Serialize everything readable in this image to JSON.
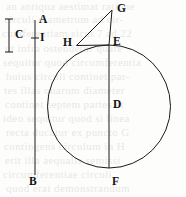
{
  "figure": {
    "width": 186,
    "height": 197,
    "background_color": "#fdfdfc",
    "stroke_color": "#1a1a1a",
    "label_color": "#111111"
  },
  "labels": {
    "A": "A",
    "B": "B",
    "C": "C",
    "D": "D",
    "E": "E",
    "F": "F",
    "G": "G",
    "H": "H",
    "I": "I"
  },
  "geometry": {
    "circle": {
      "cx": 109,
      "cy": 106.5,
      "r": 61.5
    },
    "vertical_line_AB": {
      "x": 35,
      "y_top": 20,
      "y_bottom": 175
    },
    "tick_I": {
      "x": 35,
      "y": 38,
      "half_width": 4
    },
    "measure_C": {
      "x": 9,
      "y_top": 19,
      "y_bottom": 52,
      "cap_half_width": 4
    },
    "diameter_EF": {
      "x": 109,
      "y_top": 45,
      "y_bottom": 168
    },
    "point_G": {
      "x": 112,
      "y": 10
    },
    "point_H": {
      "x": 76.5,
      "y": 45.5
    },
    "point_E": {
      "x": 109,
      "y": 45
    },
    "point_D": {
      "x": 109,
      "y": 106.5
    },
    "point_F": {
      "x": 109,
      "y": 168
    },
    "segment_GH": {
      "x1": 112,
      "y1": 10,
      "x2": 76.5,
      "y2": 45.5
    },
    "segment_GE": {
      "x1": 112,
      "y1": 10,
      "x2": 109,
      "y2": 45
    },
    "segment_HE": {
      "x1": 76.5,
      "y1": 45.5,
      "x2": 109,
      "y2": 45
    }
  },
  "label_positions": {
    "A": {
      "x": 39,
      "y": 17
    },
    "B": {
      "x": 29,
      "y": 176
    },
    "C": {
      "x": 15,
      "y": 30
    },
    "D": {
      "x": 113,
      "y": 100
    },
    "E": {
      "x": 113,
      "y": 37
    },
    "F": {
      "x": 112,
      "y": 176
    },
    "G": {
      "x": 116,
      "y": 4
    },
    "H": {
      "x": 63,
      "y": 38
    },
    "I": {
      "x": 40,
      "y": 32
    }
  },
  "ghost_text": {
    "note": "faint show-through text from reverse of printed page",
    "lines": [
      {
        "text": "an  antiqua   aestimat   ratione",
        "x": 6,
        "y": 2
      },
      {
        "text": "circuli   diametrum   ad  cir-",
        "x": 4,
        "y": 15
      },
      {
        "text": "cumferentiam   sicut   7   ad   22",
        "x": 2,
        "y": 29
      },
      {
        "text": "ut   infra   ostendetur    quare",
        "x": 5,
        "y": 44
      },
      {
        "text": "sequitur   quod   circumferentia",
        "x": 3,
        "y": 58
      },
      {
        "text": "huius   circuli   continet   par-",
        "x": 6,
        "y": 72
      },
      {
        "text": "tes   illas   quarum   diameter",
        "x": 4,
        "y": 86
      },
      {
        "text": "continet   septem   partes   et",
        "x": 5,
        "y": 100
      },
      {
        "text": "ideo  sequitur  quod  si  linea",
        "x": 3,
        "y": 114
      },
      {
        "text": "recta  ducatur  ex  puncto  G",
        "x": 6,
        "y": 128
      },
      {
        "text": "contingens  circulum  in  H",
        "x": 4,
        "y": 142
      },
      {
        "text": "erit  illa  aequalis  semissi",
        "x": 5,
        "y": 156
      },
      {
        "text": "circumferentiae   circuli",
        "x": 3,
        "y": 170
      },
      {
        "text": "quod   erat   demonstrandum",
        "x": 6,
        "y": 184
      }
    ]
  }
}
